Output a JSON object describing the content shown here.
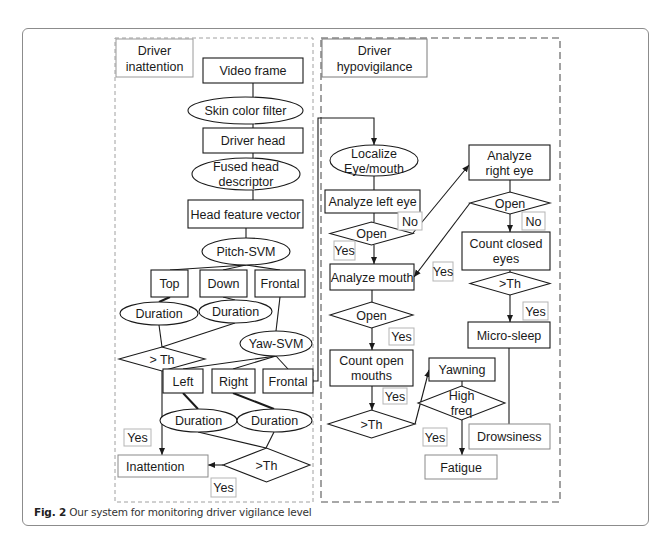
{
  "figure": {
    "caption_label": "Fig. 2",
    "caption_text": "Our system for monitoring driver vigilance level"
  },
  "panels": {
    "inattention": {
      "title_lines": [
        "Driver",
        "inattention"
      ]
    },
    "hypovigilance": {
      "title_lines": [
        "Driver",
        "hypovigilance"
      ]
    }
  },
  "nodes": [
    {
      "id": "video_frame",
      "shape": "rect",
      "x": 203,
      "y": 58,
      "w": 100,
      "h": 25,
      "lines": [
        "Video frame"
      ]
    },
    {
      "id": "skin_filter",
      "shape": "ellipse",
      "x": 188,
      "y": 97,
      "w": 115,
      "h": 27,
      "lines": [
        "Skin color filter"
      ]
    },
    {
      "id": "driver_head",
      "shape": "rect",
      "x": 203,
      "y": 128,
      "w": 100,
      "h": 25,
      "lines": [
        "Driver head"
      ]
    },
    {
      "id": "fused_desc",
      "shape": "ellipse",
      "x": 192,
      "y": 158,
      "w": 108,
      "h": 32,
      "lines": [
        "Fused head",
        "descriptor"
      ]
    },
    {
      "id": "head_vector",
      "shape": "rect",
      "x": 188,
      "y": 200,
      "w": 115,
      "h": 28,
      "lines": [
        "Head feature vector"
      ]
    },
    {
      "id": "pitch_svm",
      "shape": "ellipse",
      "x": 202,
      "y": 238,
      "w": 88,
      "h": 27,
      "lines": [
        "Pitch-SVM"
      ]
    },
    {
      "id": "top",
      "shape": "rect",
      "x": 151,
      "y": 270,
      "w": 37,
      "h": 27,
      "lines": [
        "Top"
      ]
    },
    {
      "id": "down",
      "shape": "rect",
      "x": 200,
      "y": 270,
      "w": 47,
      "h": 27,
      "lines": [
        "Down"
      ]
    },
    {
      "id": "frontal_pitch",
      "shape": "rect",
      "x": 255,
      "y": 270,
      "w": 50,
      "h": 27,
      "lines": [
        "Frontal"
      ]
    },
    {
      "id": "duration_top",
      "shape": "ellipse",
      "x": 120,
      "y": 302,
      "w": 78,
      "h": 23,
      "lines": [
        "Duration"
      ]
    },
    {
      "id": "duration_down",
      "shape": "ellipse",
      "x": 199,
      "y": 300,
      "w": 73,
      "h": 23,
      "lines": [
        "Duration"
      ]
    },
    {
      "id": "th_pitch",
      "shape": "diamond",
      "x": 119,
      "y": 347,
      "w": 86,
      "h": 24,
      "lines": [
        "> Th"
      ]
    },
    {
      "id": "yaw_svm",
      "shape": "ellipse",
      "x": 240,
      "y": 331,
      "w": 72,
      "h": 25,
      "lines": [
        "Yaw-SVM"
      ]
    },
    {
      "id": "left",
      "shape": "rect",
      "x": 163,
      "y": 369,
      "w": 40,
      "h": 24,
      "lines": [
        "Left"
      ]
    },
    {
      "id": "right",
      "shape": "rect",
      "x": 212,
      "y": 369,
      "w": 43,
      "h": 24,
      "lines": [
        "Right"
      ]
    },
    {
      "id": "frontal_yaw",
      "shape": "rect",
      "x": 263,
      "y": 369,
      "w": 50,
      "h": 24,
      "lines": [
        "Frontal"
      ]
    },
    {
      "id": "duration_left",
      "shape": "ellipse",
      "x": 160,
      "y": 409,
      "w": 77,
      "h": 23,
      "lines": [
        "Duration"
      ]
    },
    {
      "id": "duration_right",
      "shape": "ellipse",
      "x": 237,
      "y": 409,
      "w": 75,
      "h": 23,
      "lines": [
        "Duration"
      ]
    },
    {
      "id": "inattention",
      "shape": "rect-light",
      "x": 118,
      "y": 455,
      "w": 90,
      "h": 22,
      "lines": [
        "Inattention"
      ],
      "align": "left"
    },
    {
      "id": "th_yaw",
      "shape": "diamond",
      "x": 223,
      "y": 448,
      "w": 87,
      "h": 34,
      "lines": [
        ">Th"
      ]
    },
    {
      "id": "localize",
      "shape": "ellipse",
      "x": 330,
      "y": 145,
      "w": 88,
      "h": 31,
      "lines": [
        "Localize",
        "Eye/mouth"
      ]
    },
    {
      "id": "analyze_left",
      "shape": "rect",
      "x": 325,
      "y": 190,
      "w": 95,
      "h": 23,
      "lines": [
        "Analyze left eye"
      ]
    },
    {
      "id": "open_left",
      "shape": "diamond",
      "x": 330,
      "y": 222,
      "w": 83,
      "h": 23,
      "lines": [
        "Open"
      ]
    },
    {
      "id": "analyze_mouth",
      "shape": "rect",
      "x": 330,
      "y": 264,
      "w": 84,
      "h": 26,
      "lines": [
        "Analyze mouth"
      ]
    },
    {
      "id": "analyze_right",
      "shape": "rect",
      "x": 469,
      "y": 145,
      "w": 81,
      "h": 35,
      "lines": [
        "Analyze",
        "right eye"
      ]
    },
    {
      "id": "open_right",
      "shape": "diamond",
      "x": 470,
      "y": 192,
      "w": 80,
      "h": 22,
      "lines": [
        "Open"
      ]
    },
    {
      "id": "count_closed",
      "shape": "rect",
      "x": 462,
      "y": 232,
      "w": 88,
      "h": 38,
      "lines": [
        "Count closed",
        "eyes"
      ]
    },
    {
      "id": "th_eyes",
      "shape": "diamond",
      "x": 470,
      "y": 272,
      "w": 80,
      "h": 23,
      "lines": [
        ">Th"
      ]
    },
    {
      "id": "micro_sleep",
      "shape": "rect",
      "x": 468,
      "y": 322,
      "w": 82,
      "h": 26,
      "lines": [
        "Micro-sleep"
      ]
    },
    {
      "id": "open_mouth",
      "shape": "diamond",
      "x": 330,
      "y": 302,
      "w": 83,
      "h": 26,
      "lines": [
        "Open"
      ]
    },
    {
      "id": "count_open",
      "shape": "rect",
      "x": 330,
      "y": 350,
      "w": 83,
      "h": 36,
      "lines": [
        "Count open",
        "mouths"
      ]
    },
    {
      "id": "yawning",
      "shape": "rect",
      "x": 429,
      "y": 358,
      "w": 66,
      "h": 23,
      "lines": [
        "Yawning"
      ]
    },
    {
      "id": "high_freq",
      "shape": "diamond",
      "x": 418,
      "y": 386,
      "w": 87,
      "h": 34,
      "lines": [
        "High",
        "freq"
      ]
    },
    {
      "id": "th_mouth",
      "shape": "diamond",
      "x": 328,
      "y": 410,
      "w": 87,
      "h": 28,
      "lines": [
        ">Th"
      ]
    },
    {
      "id": "drowsiness",
      "shape": "rect-light",
      "x": 469,
      "y": 424,
      "w": 81,
      "h": 25,
      "lines": [
        "Drowsiness"
      ],
      "align": "left"
    },
    {
      "id": "fatigue",
      "shape": "rect-light",
      "x": 425,
      "y": 455,
      "w": 72,
      "h": 24,
      "lines": [
        "Fatigue"
      ]
    }
  ],
  "tags": [
    {
      "id": "yes_inatt_1",
      "x": 124,
      "y": 429,
      "w": 27,
      "h": 17,
      "text": "Yes"
    },
    {
      "id": "yes_inatt_2",
      "x": 211,
      "y": 478,
      "w": 25,
      "h": 19,
      "text": "Yes"
    },
    {
      "id": "no_left",
      "x": 398,
      "y": 212,
      "w": 24,
      "h": 18,
      "text": "No"
    },
    {
      "id": "yes_left",
      "x": 334,
      "y": 241,
      "w": 21,
      "h": 19,
      "text": "Yes"
    },
    {
      "id": "yes_right",
      "x": 433,
      "y": 262,
      "w": 20,
      "h": 19,
      "text": "Yes"
    },
    {
      "id": "no_right",
      "x": 522,
      "y": 212,
      "w": 23,
      "h": 18,
      "text": "No"
    },
    {
      "id": "yes_eyes",
      "x": 523,
      "y": 302,
      "w": 25,
      "h": 18,
      "text": "Yes"
    },
    {
      "id": "yes_mouth",
      "x": 389,
      "y": 328,
      "w": 25,
      "h": 17,
      "text": "Yes"
    },
    {
      "id": "yes_count",
      "x": 383,
      "y": 388,
      "w": 24,
      "h": 16,
      "text": "Yes"
    },
    {
      "id": "yes_freq",
      "x": 423,
      "y": 428,
      "w": 24,
      "h": 18,
      "text": "Yes"
    }
  ],
  "edges": [
    {
      "pts": [
        [
          253,
          83
        ],
        [
          253,
          97
        ]
      ]
    },
    {
      "pts": [
        [
          253,
          124
        ],
        [
          253,
          128
        ]
      ]
    },
    {
      "pts": [
        [
          253,
          153
        ],
        [
          253,
          158
        ]
      ]
    },
    {
      "pts": [
        [
          253,
          190
        ],
        [
          253,
          200
        ]
      ]
    },
    {
      "pts": [
        [
          246,
          228
        ],
        [
          246,
          238
        ]
      ]
    },
    {
      "pts": [
        [
          246,
          265
        ],
        [
          170,
          270
        ]
      ]
    },
    {
      "pts": [
        [
          246,
          265
        ],
        [
          223,
          270
        ]
      ]
    },
    {
      "pts": [
        [
          246,
          265
        ],
        [
          280,
          270
        ]
      ]
    },
    {
      "pts": [
        [
          170,
          297
        ],
        [
          159,
          302
        ]
      ],
      "bold": true
    },
    {
      "pts": [
        [
          223,
          297
        ],
        [
          235,
          300
        ]
      ]
    },
    {
      "pts": [
        [
          159,
          325
        ],
        [
          162,
          347
        ]
      ]
    },
    {
      "pts": [
        [
          235,
          323
        ],
        [
          162,
          347
        ]
      ]
    },
    {
      "pts": [
        [
          280,
          297
        ],
        [
          276,
          331
        ]
      ]
    },
    {
      "pts": [
        [
          276,
          356
        ],
        [
          183,
          369
        ]
      ]
    },
    {
      "pts": [
        [
          276,
          356
        ],
        [
          233,
          369
        ]
      ]
    },
    {
      "pts": [
        [
          276,
          356
        ],
        [
          288,
          369
        ]
      ]
    },
    {
      "pts": [
        [
          183,
          393
        ],
        [
          198,
          409
        ]
      ],
      "bold": true
    },
    {
      "pts": [
        [
          233,
          393
        ],
        [
          274,
          409
        ]
      ],
      "bold": true
    },
    {
      "pts": [
        [
          198,
          432
        ],
        [
          266,
          448
        ]
      ]
    },
    {
      "pts": [
        [
          274,
          432
        ],
        [
          266,
          448
        ]
      ]
    },
    {
      "pts": [
        [
          162,
          371
        ],
        [
          162,
          455
        ]
      ],
      "arrow": true
    },
    {
      "pts": [
        [
          223,
          465
        ],
        [
          208,
          465
        ]
      ],
      "arrow": true
    },
    {
      "pts": [
        [
          313,
          381
        ],
        [
          318,
          381
        ],
        [
          318,
          118
        ],
        [
          374,
          118
        ],
        [
          374,
          145
        ]
      ],
      "arrow": true
    },
    {
      "pts": [
        [
          374,
          176
        ],
        [
          374,
          190
        ]
      ]
    },
    {
      "pts": [
        [
          374,
          213
        ],
        [
          374,
          222
        ]
      ]
    },
    {
      "pts": [
        [
          374,
          245
        ],
        [
          374,
          264
        ]
      ],
      "arrow": true
    },
    {
      "pts": [
        [
          413,
          233
        ],
        [
          469,
          165
        ]
      ],
      "arrow": true
    },
    {
      "pts": [
        [
          510,
          180
        ],
        [
          510,
          192
        ]
      ]
    },
    {
      "pts": [
        [
          510,
          214
        ],
        [
          510,
          232
        ]
      ],
      "arrow": true
    },
    {
      "pts": [
        [
          470,
          203
        ],
        [
          414,
          277
        ]
      ],
      "arrow": true
    },
    {
      "pts": [
        [
          510,
          270
        ],
        [
          510,
          272
        ]
      ]
    },
    {
      "pts": [
        [
          510,
          295
        ],
        [
          510,
          322
        ]
      ],
      "arrow": true
    },
    {
      "pts": [
        [
          372,
          290
        ],
        [
          372,
          302
        ]
      ]
    },
    {
      "pts": [
        [
          372,
          328
        ],
        [
          372,
          350
        ]
      ],
      "arrow": true
    },
    {
      "pts": [
        [
          372,
          386
        ],
        [
          372,
          410
        ]
      ],
      "arrow": true
    },
    {
      "pts": [
        [
          415,
          424
        ],
        [
          429,
          370
        ]
      ],
      "arrow": true
    },
    {
      "pts": [
        [
          462,
          381
        ],
        [
          462,
          386
        ]
      ]
    },
    {
      "pts": [
        [
          462,
          420
        ],
        [
          462,
          455
        ]
      ],
      "arrow": true
    },
    {
      "pts": [
        [
          509,
          348
        ],
        [
          509,
          424
        ]
      ]
    }
  ]
}
